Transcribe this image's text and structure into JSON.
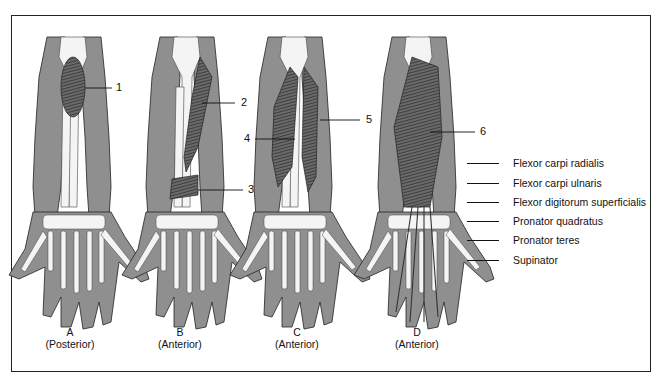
{
  "figure": {
    "panels": [
      {
        "letter": "A",
        "view": "(Posterior)",
        "marker": "1"
      },
      {
        "letter": "B",
        "view": "(Anterior)",
        "marker": "2",
        "marker2": "3"
      },
      {
        "letter": "C",
        "view": "(Anterior)",
        "marker": "4",
        "marker2": "5"
      },
      {
        "letter": "D",
        "view": "(Anterior)",
        "marker": "6"
      }
    ],
    "legend": [
      "Flexor carpi radialis",
      "Flexor carpi ulnaris",
      "Flexor digitorum superficialis",
      "Pronator quadratus",
      "Pronator teres",
      "Supinator"
    ],
    "colors": {
      "skin": "#8f8f8f",
      "bone": "#f4f4f4",
      "muscle": "#555555",
      "outline": "#222222"
    }
  }
}
